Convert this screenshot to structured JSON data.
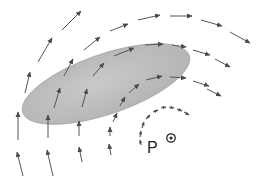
{
  "diagram": {
    "surface": {
      "shape": "ellipse",
      "fill": "#bdbdbd",
      "stroke": "#9a9a9a"
    },
    "field_lines": {
      "color": "#555555",
      "count": 4,
      "style": "arrow segments"
    },
    "circulation": {
      "style": "dotted arc with arrowheads",
      "color": "#555555"
    },
    "point": {
      "label": "P",
      "symbol": "out-of-page",
      "symbol_name": "dot-in-circle"
    }
  }
}
